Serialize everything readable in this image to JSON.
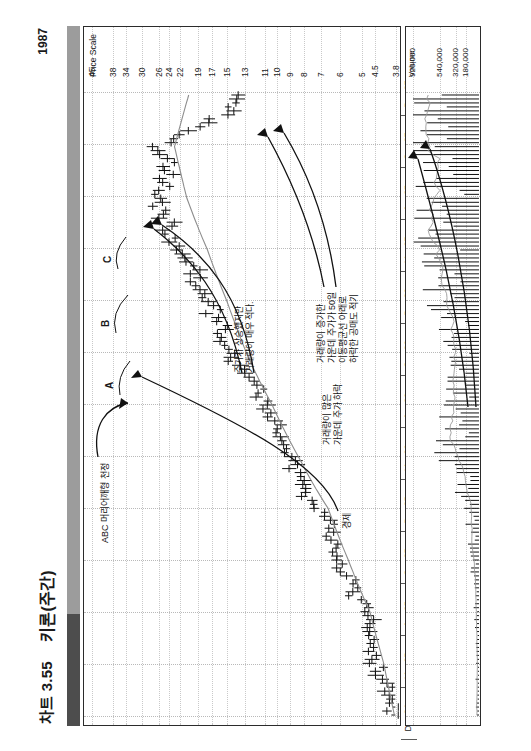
{
  "header": {
    "chart_number": "차트 3.55",
    "instrument": "키론(주간)",
    "year": "1987"
  },
  "price_axis": {
    "title": "Price Scale",
    "ticks": [
      "45",
      "38",
      "34",
      "30",
      "26",
      "24",
      "22",
      "19",
      "17",
      "15",
      "13",
      "11",
      "10",
      "9",
      "8",
      "7",
      "6",
      "5",
      "4.5",
      "3.8"
    ]
  },
  "volume_axis": {
    "title": "Volume",
    "ticks": [
      "920,000",
      "540,000",
      "320,000",
      "180,000"
    ]
  },
  "x_axis": {
    "ticks": [
      "Dec 84",
      "Mar 85",
      "Jun 85",
      "Sep 85",
      "Dec 85",
      "Mar 86",
      "Jun 86",
      "Sep 86",
      "Dec 86",
      "Mar 87",
      "Jun 87",
      "Sep 87",
      "Dec 87"
    ]
  },
  "annotations": {
    "abc_top": "ABC 머리어깨형 천정",
    "letter_a": "A",
    "letter_b": "B",
    "letter_c": "C",
    "price_up_low_volume": "주가가 상승했지만\n거래량이 매우 적다.",
    "high_volume_breakdown": "거래량이 증가한\n가운데 주가가 50일\n이동평균선 아래로\n하락한 공매도 적기",
    "low_volume_midline": "거래량이 많은\n가운데 주가 하락",
    "neckline": "경제"
  },
  "colors": {
    "ink": "#111111",
    "moving_average": "#8d8d8d",
    "grid": "#c0c0c0",
    "spine_dark": "#4d4d4d",
    "spine_light": "#9c9c9c"
  },
  "chart_data": {
    "type": "line",
    "title": "차트 3.55  키론(주간)  1987",
    "xlabel": "",
    "ylabel": "Price Scale",
    "scale": "logarithmic",
    "ylim": [
      3.8,
      45
    ],
    "xlim": [
      "Dec 84",
      "Dec 87"
    ],
    "grid": true,
    "legend": "none",
    "series": [
      {
        "name": "Price (weekly high-low-close bars)",
        "type": "ohlc",
        "note": "weekly bars, approx close values read off the log price scale",
        "x": [
          "Dec 84",
          "Jan 85",
          "Feb 85",
          "Mar 85",
          "Apr 85",
          "May 85",
          "Jun 85",
          "Jul 85",
          "Aug 85",
          "Sep 85",
          "Oct 85",
          "Nov 85",
          "Dec 85",
          "Jan 86",
          "Feb 86",
          "Mar 86",
          "Apr 86",
          "May 86",
          "Jun 86",
          "Jul 86",
          "Aug 86",
          "Sep 86",
          "Oct 86",
          "Nov 86",
          "Dec 86",
          "Jan 87",
          "Feb 87",
          "Mar 87",
          "Apr 87",
          "May 87",
          "Jun 87",
          "Jul 87",
          "Aug 87",
          "Sep 87",
          "Oct 87",
          "Nov 87",
          "Dec 87"
        ],
        "values": [
          3.9,
          4.0,
          4.2,
          4.4,
          4.6,
          4.7,
          4.9,
          5.2,
          5.6,
          6.0,
          6.3,
          6.6,
          7.2,
          8.0,
          8.6,
          9.2,
          9.8,
          10.5,
          11.2,
          12.0,
          13.2,
          14.5,
          15.5,
          16.5,
          17.5,
          19.0,
          20.5,
          22.0,
          24.0,
          25.5,
          26.0,
          25.0,
          24.0,
          26.0,
          19.0,
          15.0,
          13.0
        ]
      },
      {
        "name": "50-week moving average",
        "type": "line",
        "x": [
          "Dec 84",
          "Mar 85",
          "Jun 85",
          "Sep 85",
          "Dec 85",
          "Mar 86",
          "Jun 86",
          "Sep 86",
          "Dec 86",
          "Mar 87",
          "Jun 87",
          "Sep 87",
          "Dec 87"
        ],
        "values": [
          3.85,
          4.2,
          4.7,
          5.6,
          6.6,
          8.4,
          10.4,
          12.8,
          15.0,
          17.6,
          20.8,
          23.0,
          20.5
        ]
      }
    ],
    "volume": {
      "type": "bar",
      "ylabel": "Volume",
      "ylim": [
        0,
        920000
      ],
      "yticks": [
        180000,
        320000,
        540000,
        920000
      ],
      "x": [
        "Dec 84",
        "Mar 85",
        "Jun 85",
        "Sep 85",
        "Dec 85",
        "Mar 86",
        "Jun 86",
        "Sep 86",
        "Dec 86",
        "Mar 87",
        "Jun 87",
        "Sep 87",
        "Dec 87"
      ],
      "values": [
        30000,
        40000,
        60000,
        90000,
        150000,
        420000,
        380000,
        300000,
        520000,
        700000,
        560000,
        880000,
        620000
      ]
    }
  }
}
